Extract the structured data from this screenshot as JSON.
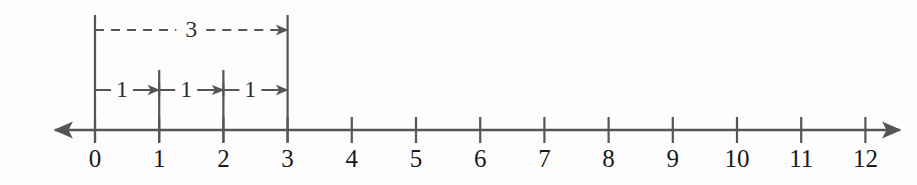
{
  "figure": {
    "background_color": "#fdfdfd",
    "line_color": "#555555",
    "label_color": "#1a1a1a",
    "measure_label_color": "#303030"
  },
  "number_line": {
    "axis_y": 130,
    "origin_x": 95,
    "unit_px": 64.2,
    "left_arrow_x": 55,
    "right_arrow_x": 900,
    "tick_half_height": 13,
    "min": 0,
    "max": 12,
    "ticks": [
      {
        "value": 0,
        "label": "0"
      },
      {
        "value": 1,
        "label": "1"
      },
      {
        "value": 2,
        "label": "2"
      },
      {
        "value": 3,
        "label": "3"
      },
      {
        "value": 4,
        "label": "4"
      },
      {
        "value": 5,
        "label": "5"
      },
      {
        "value": 6,
        "label": "6"
      },
      {
        "value": 7,
        "label": "7"
      },
      {
        "value": 8,
        "label": "8"
      },
      {
        "value": 9,
        "label": "9"
      },
      {
        "value": 10,
        "label": "10"
      },
      {
        "value": 11,
        "label": "11"
      },
      {
        "value": 12,
        "label": "12"
      }
    ],
    "label_baseline_y": 167
  },
  "guides": [
    {
      "name": "guide-0",
      "value": 0,
      "y_top": 15,
      "y_bottom": 142
    },
    {
      "name": "guide-1",
      "value": 1,
      "y_top": 70,
      "y_bottom": 142
    },
    {
      "name": "guide-2",
      "value": 2,
      "y_top": 70,
      "y_bottom": 142
    },
    {
      "name": "guide-3",
      "value": 3,
      "y_top": 15,
      "y_bottom": 142
    }
  ],
  "measurements": {
    "total": {
      "name": "total-span-arrow",
      "label": "3",
      "from": 0,
      "to": 3,
      "y": 30,
      "style": "dashed",
      "dash_pattern": "9 7",
      "label_center": 1.5
    },
    "unit_jumps": [
      {
        "name": "unit-jump-1",
        "label": "1",
        "from": 0,
        "to": 1,
        "y": 90,
        "style": "solid",
        "label_center": 0.42
      },
      {
        "name": "unit-jump-2",
        "label": "1",
        "from": 1,
        "to": 2,
        "y": 90,
        "style": "solid",
        "label_center": 1.42
      },
      {
        "name": "unit-jump-3",
        "label": "1",
        "from": 2,
        "to": 3,
        "y": 90,
        "style": "solid",
        "label_center": 2.42
      }
    ]
  }
}
